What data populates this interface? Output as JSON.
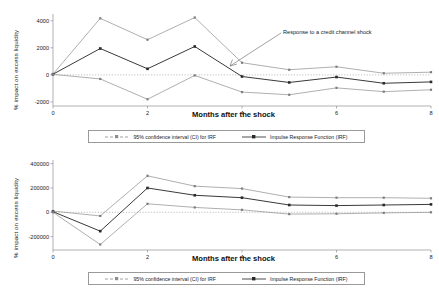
{
  "figure": {
    "background": "#ffffff",
    "series_colors": {
      "ci": "#8c8c8c",
      "irf": "#3a3a3a",
      "zero": "#b0b0b0"
    }
  },
  "legend": {
    "ci_label": "95% confidence interval (CI) for IRF",
    "irf_label": "Impulse Response Function (IRF)"
  },
  "chart_data": [
    {
      "id": "top",
      "type": "line",
      "title": "",
      "annotation": "Response to a credit channel shock",
      "xlabel": "Months after the shock",
      "ylabel": "% impact on excess liquidity",
      "x": [
        0,
        1,
        2,
        3,
        4,
        5,
        6,
        7,
        8
      ],
      "xticks": [
        0,
        2,
        4,
        6,
        8
      ],
      "xticklabels": [
        "0",
        "2",
        "4",
        "6",
        "8"
      ],
      "yticks": [
        -2000,
        0,
        2000,
        4000
      ],
      "yticklabels": [
        "-2000",
        "0",
        "2000",
        "4000"
      ],
      "xlim": [
        0,
        8
      ],
      "ylim": [
        -2300,
        4500
      ],
      "grid": false,
      "zero_line": true,
      "series": [
        {
          "name": "95% confidence interval (CI) for IRF",
          "role": "ci_upper",
          "values": [
            60,
            4180,
            2600,
            4240,
            900,
            380,
            600,
            120,
            200
          ]
        },
        {
          "name": "Impulse Response Function (IRF)",
          "role": "irf",
          "values": [
            50,
            1950,
            450,
            2100,
            -120,
            -560,
            -160,
            -620,
            -520
          ]
        },
        {
          "name": "95% confidence interval (CI) for IRF",
          "role": "ci_lower",
          "values": [
            40,
            -300,
            -1800,
            -40,
            -1270,
            -1470,
            -960,
            -1240,
            -1100
          ]
        }
      ]
    },
    {
      "id": "bottom",
      "type": "line",
      "title": "",
      "annotation": "",
      "xlabel": "Months after the shock",
      "ylabel": "% impact on excess liquidity",
      "x": [
        0,
        1,
        2,
        3,
        4,
        5,
        6,
        7,
        8
      ],
      "xticks": [
        0,
        2,
        4,
        6,
        8
      ],
      "xticklabels": [
        "0",
        "2",
        "4",
        "6",
        "8"
      ],
      "yticks": [
        -200000,
        0,
        200000,
        400000
      ],
      "yticklabels": [
        "-200000",
        "0",
        "200000",
        "400000"
      ],
      "xlim": [
        0,
        8
      ],
      "ylim": [
        -310000,
        430000
      ],
      "grid": false,
      "zero_line": true,
      "series": [
        {
          "name": "95% confidence interval (CI) for IRF",
          "role": "ci_upper",
          "values": [
            10000,
            -30000,
            300000,
            215000,
            195000,
            125000,
            120000,
            120000,
            115000
          ]
        },
        {
          "name": "Impulse Response Function (IRF)",
          "role": "irf",
          "values": [
            5000,
            -155000,
            200000,
            140000,
            120000,
            60000,
            55000,
            60000,
            65000
          ]
        },
        {
          "name": "95% confidence interval (CI) for IRF",
          "role": "ci_lower",
          "values": [
            0,
            -265000,
            70000,
            40000,
            20000,
            -15000,
            -12000,
            -5000,
            0
          ]
        }
      ]
    }
  ]
}
